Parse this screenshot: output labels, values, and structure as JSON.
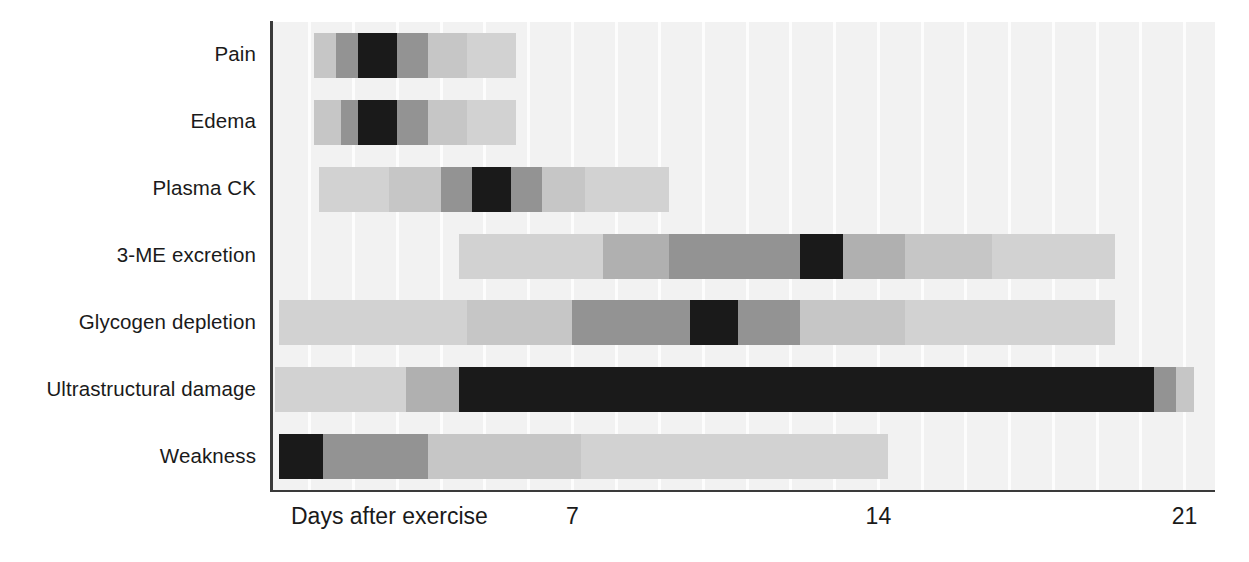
{
  "chart_data": {
    "type": "bar",
    "subtype": "horizontal-gantt-intensity",
    "title": "",
    "xlabel": "Days after exercise",
    "ylabel": "",
    "xlim": [
      0,
      22.5
    ],
    "xticks": [
      7,
      14,
      21
    ],
    "xtick_labels": [
      "7",
      "14",
      "21"
    ],
    "grid": true,
    "grid_interval_days": 1,
    "legend": "none",
    "intensity_scale": {
      "description": "Greyscale intensity encodes magnitude of response; darker = peak response",
      "levels": [
        {
          "level": 0,
          "name": "none",
          "color": "#f2f2f2"
        },
        {
          "level": 1,
          "name": "very-low",
          "color": "#e0e0e0"
        },
        {
          "level": 2,
          "name": "low",
          "color": "#d2d2d2"
        },
        {
          "level": 3,
          "name": "mild",
          "color": "#c6c6c6"
        },
        {
          "level": 4,
          "name": "moderate",
          "color": "#b0b0b0"
        },
        {
          "level": 5,
          "name": "high",
          "color": "#939393"
        },
        {
          "level": 6,
          "name": "very-high",
          "color": "#7a7a7a"
        },
        {
          "level": 7,
          "name": "peak",
          "color": "#1a1a1a"
        }
      ]
    },
    "categories": [
      "Pain",
      "Edema",
      "Plasma CK",
      "3-ME excretion",
      "Glycogen depletion",
      "Ultrastructural damage",
      "Weakness"
    ],
    "series": [
      {
        "name": "Pain",
        "start_day": 1.1,
        "end_day": 5.7,
        "peak_day_range": [
          2.1,
          3.0
        ],
        "segments": [
          {
            "start_day": 1.1,
            "end_day": 1.6,
            "level": 3,
            "color": "#c6c6c6"
          },
          {
            "start_day": 1.6,
            "end_day": 2.1,
            "level": 5,
            "color": "#939393"
          },
          {
            "start_day": 2.1,
            "end_day": 3.0,
            "level": 7,
            "color": "#1a1a1a"
          },
          {
            "start_day": 3.0,
            "end_day": 3.7,
            "level": 5,
            "color": "#939393"
          },
          {
            "start_day": 3.7,
            "end_day": 4.6,
            "level": 3,
            "color": "#c6c6c6"
          },
          {
            "start_day": 4.6,
            "end_day": 5.7,
            "level": 2,
            "color": "#d2d2d2"
          }
        ]
      },
      {
        "name": "Edema",
        "start_day": 1.1,
        "end_day": 5.7,
        "peak_day_range": [
          2.1,
          3.0
        ],
        "segments": [
          {
            "start_day": 1.1,
            "end_day": 1.7,
            "level": 3,
            "color": "#c6c6c6"
          },
          {
            "start_day": 1.7,
            "end_day": 2.1,
            "level": 5,
            "color": "#939393"
          },
          {
            "start_day": 2.1,
            "end_day": 3.0,
            "level": 7,
            "color": "#1a1a1a"
          },
          {
            "start_day": 3.0,
            "end_day": 3.7,
            "level": 5,
            "color": "#939393"
          },
          {
            "start_day": 3.7,
            "end_day": 4.6,
            "level": 3,
            "color": "#c6c6c6"
          },
          {
            "start_day": 4.6,
            "end_day": 5.7,
            "level": 2,
            "color": "#d2d2d2"
          }
        ]
      },
      {
        "name": "Plasma CK",
        "start_day": 1.2,
        "end_day": 9.2,
        "peak_day_range": [
          4.7,
          5.6
        ],
        "segments": [
          {
            "start_day": 1.2,
            "end_day": 2.8,
            "level": 2,
            "color": "#d2d2d2"
          },
          {
            "start_day": 2.8,
            "end_day": 4.0,
            "level": 3,
            "color": "#c6c6c6"
          },
          {
            "start_day": 4.0,
            "end_day": 4.7,
            "level": 5,
            "color": "#939393"
          },
          {
            "start_day": 4.7,
            "end_day": 5.6,
            "level": 7,
            "color": "#1a1a1a"
          },
          {
            "start_day": 5.6,
            "end_day": 6.3,
            "level": 5,
            "color": "#939393"
          },
          {
            "start_day": 6.3,
            "end_day": 7.3,
            "level": 3,
            "color": "#c6c6c6"
          },
          {
            "start_day": 7.3,
            "end_day": 9.2,
            "level": 2,
            "color": "#d2d2d2"
          }
        ]
      },
      {
        "name": "3-ME excretion",
        "start_day": 4.4,
        "end_day": 19.4,
        "peak_day_range": [
          12.2,
          13.2
        ],
        "segments": [
          {
            "start_day": 4.4,
            "end_day": 7.7,
            "level": 2,
            "color": "#d2d2d2"
          },
          {
            "start_day": 7.7,
            "end_day": 9.2,
            "level": 4,
            "color": "#b0b0b0"
          },
          {
            "start_day": 9.2,
            "end_day": 12.2,
            "level": 5,
            "color": "#939393"
          },
          {
            "start_day": 12.2,
            "end_day": 13.2,
            "level": 7,
            "color": "#1a1a1a"
          },
          {
            "start_day": 13.2,
            "end_day": 14.6,
            "level": 4,
            "color": "#b0b0b0"
          },
          {
            "start_day": 14.6,
            "end_day": 16.6,
            "level": 3,
            "color": "#c6c6c6"
          },
          {
            "start_day": 16.6,
            "end_day": 19.4,
            "level": 2,
            "color": "#d2d2d2"
          }
        ]
      },
      {
        "name": "Glycogen depletion",
        "start_day": 0.3,
        "end_day": 19.4,
        "peak_day_range": [
          9.7,
          10.8
        ],
        "segments": [
          {
            "start_day": 0.3,
            "end_day": 4.6,
            "level": 2,
            "color": "#d2d2d2"
          },
          {
            "start_day": 4.6,
            "end_day": 7.0,
            "level": 3,
            "color": "#c6c6c6"
          },
          {
            "start_day": 7.0,
            "end_day": 9.7,
            "level": 5,
            "color": "#939393"
          },
          {
            "start_day": 9.7,
            "end_day": 10.8,
            "level": 7,
            "color": "#1a1a1a"
          },
          {
            "start_day": 10.8,
            "end_day": 12.2,
            "level": 5,
            "color": "#939393"
          },
          {
            "start_day": 12.2,
            "end_day": 14.6,
            "level": 3,
            "color": "#c6c6c6"
          },
          {
            "start_day": 14.6,
            "end_day": 19.4,
            "level": 2,
            "color": "#d2d2d2"
          }
        ]
      },
      {
        "name": "Ultrastructural damage",
        "start_day": 0.2,
        "end_day": 21.2,
        "peak_day_range": [
          4.4,
          20.3
        ],
        "segments": [
          {
            "start_day": 0.2,
            "end_day": 3.2,
            "level": 2,
            "color": "#d2d2d2"
          },
          {
            "start_day": 3.2,
            "end_day": 4.4,
            "level": 4,
            "color": "#b0b0b0"
          },
          {
            "start_day": 4.4,
            "end_day": 20.3,
            "level": 7,
            "color": "#1a1a1a"
          },
          {
            "start_day": 20.3,
            "end_day": 20.8,
            "level": 5,
            "color": "#939393"
          },
          {
            "start_day": 20.8,
            "end_day": 21.2,
            "level": 3,
            "color": "#c6c6c6"
          }
        ]
      },
      {
        "name": "Weakness",
        "start_day": 0.3,
        "end_day": 14.2,
        "peak_day_range": [
          0.3,
          1.3
        ],
        "segments": [
          {
            "start_day": 0.3,
            "end_day": 1.3,
            "level": 7,
            "color": "#1a1a1a"
          },
          {
            "start_day": 1.3,
            "end_day": 3.7,
            "level": 5,
            "color": "#939393"
          },
          {
            "start_day": 3.7,
            "end_day": 7.2,
            "level": 3,
            "color": "#c6c6c6"
          },
          {
            "start_day": 7.2,
            "end_day": 14.2,
            "level": 2,
            "color": "#d2d2d2"
          }
        ]
      }
    ]
  },
  "axis": {
    "title": "Days after exercise",
    "ticks": [
      "7",
      "14",
      "21"
    ]
  },
  "footer": {
    "smudge": ""
  }
}
